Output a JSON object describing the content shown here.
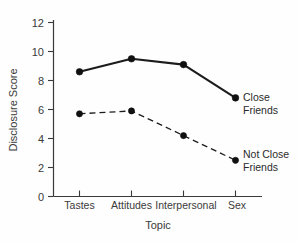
{
  "chart_data": {
    "type": "line",
    "title": "",
    "xlabel": "Topic",
    "ylabel": "Disclosure Score",
    "categories": [
      "Tastes",
      "Attitudes",
      "Interpersonal",
      "Sex"
    ],
    "ylim": [
      0,
      12
    ],
    "yticks": [
      0,
      2,
      4,
      6,
      8,
      10,
      12
    ],
    "ytick_labels": [
      "0",
      "2",
      "4",
      "6",
      "8",
      "10",
      "12"
    ],
    "grid": false,
    "legend_position": "right-inline",
    "series": [
      {
        "name": "Close Friends",
        "style": "solid",
        "color": "#1c1c1c",
        "marker": "filled-circle",
        "values": [
          8.6,
          9.5,
          9.1,
          6.8
        ],
        "label_line1": "Close",
        "label_line2": "Friends"
      },
      {
        "name": "Not Close Friends",
        "style": "dashed",
        "color": "#1c1c1c",
        "marker": "filled-circle",
        "values": [
          5.7,
          5.9,
          4.2,
          2.5
        ],
        "label_line1": "Not Close",
        "label_line2": "Friends"
      }
    ]
  },
  "axes": {
    "y_title": "Disclosure Score",
    "x_title": "Topic",
    "y_tick_0": "0",
    "y_tick_1": "2",
    "y_tick_2": "4",
    "y_tick_3": "6",
    "y_tick_4": "8",
    "y_tick_5": "10",
    "y_tick_6": "12",
    "x_tick_0": "Tastes",
    "x_tick_1": "Attitudes",
    "x_tick_2": "Interpersonal",
    "x_tick_3": "Sex"
  },
  "legend": {
    "close_line1": "Close",
    "close_line2": "Friends",
    "notclose_line1": "Not Close",
    "notclose_line2": "Friends"
  },
  "colors": {
    "ink": "#1c1c1c",
    "axis": "#3a3a3a",
    "background": "#fefefe"
  }
}
